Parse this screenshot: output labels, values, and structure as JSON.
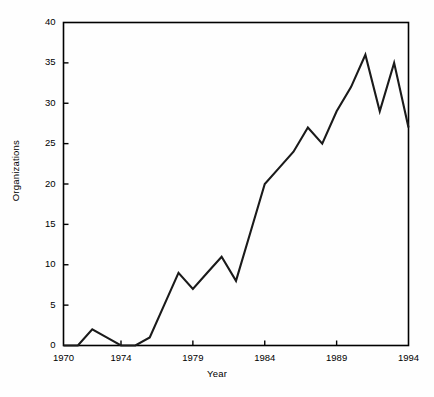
{
  "figure": {
    "background_color": "#fefefe",
    "line_color": "#1a1a1a",
    "axis_color": "#000000"
  },
  "chart_data": {
    "type": "line",
    "title": "",
    "xlabel": "Year",
    "ylabel": "Organizations",
    "xlim": [
      1970,
      1994
    ],
    "ylim": [
      0,
      40
    ],
    "grid": false,
    "legend": null,
    "xticks": [
      1970,
      1974,
      1979,
      1984,
      1989,
      1994
    ],
    "xticklabels": [
      "1970",
      "1974",
      "1979",
      "1984",
      "1989",
      "1994"
    ],
    "yticks": [
      0,
      5,
      10,
      15,
      20,
      25,
      30,
      35,
      40
    ],
    "yticklabels": [
      "0",
      "5",
      "10",
      "15",
      "20",
      "25",
      "30",
      "35",
      "40"
    ],
    "x": [
      1970,
      1971,
      1972,
      1973,
      1974,
      1975,
      1976,
      1977,
      1978,
      1979,
      1980,
      1981,
      1982,
      1983,
      1984,
      1985,
      1986,
      1987,
      1988,
      1989,
      1990,
      1991,
      1992,
      1993,
      1994
    ],
    "values": [
      0,
      0,
      2,
      1,
      0,
      0,
      1,
      5,
      9,
      7,
      9,
      11,
      8,
      14,
      20,
      22,
      24,
      27,
      25,
      29,
      32,
      36,
      29,
      35,
      27
    ],
    "series": [
      {
        "name": "Organizations",
        "values": [
          0,
          0,
          2,
          1,
          0,
          0,
          1,
          5,
          9,
          7,
          9,
          11,
          8,
          14,
          20,
          22,
          24,
          27,
          25,
          29,
          32,
          36,
          29,
          35,
          27
        ]
      }
    ]
  }
}
